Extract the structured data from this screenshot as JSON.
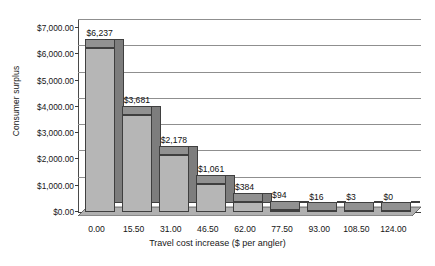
{
  "chart_data": {
    "type": "bar",
    "title": "",
    "xlabel": "Travel cost increase ($ per angler)",
    "ylabel": "Consumer surplus",
    "categories": [
      "0.00",
      "15.50",
      "31.00",
      "46.50",
      "62.00",
      "77.50",
      "93.00",
      "108.50",
      "124.00"
    ],
    "values": [
      6237,
      3681,
      2178,
      1061,
      384,
      94,
      16,
      3,
      0
    ],
    "data_labels": [
      "$6,237",
      "$3,681",
      "$2,178",
      "$1,061",
      "$384",
      "$94",
      "$16",
      "$3",
      "$0"
    ],
    "ylim": [
      0,
      7000
    ],
    "ytick_labels": [
      "$7,000.00",
      "$6,000.00",
      "$5,000.00",
      "$4,000.00",
      "$3,000.00",
      "$2,000.00",
      "$1,000.00",
      "$0.00"
    ],
    "ytick_values": [
      7000,
      6000,
      5000,
      4000,
      3000,
      2000,
      1000,
      0
    ],
    "grid": true,
    "legend": false,
    "style": "3d-column",
    "colors": {
      "bar_front": "#b6b6b6",
      "bar_side": "#7d7d7d",
      "bar_top": "#919191",
      "bar_outline": "#3f3f3f",
      "gridline": "#8f8f8f",
      "axis": "#3d3d3d",
      "text": "#161616",
      "background": "#ffffff"
    }
  }
}
